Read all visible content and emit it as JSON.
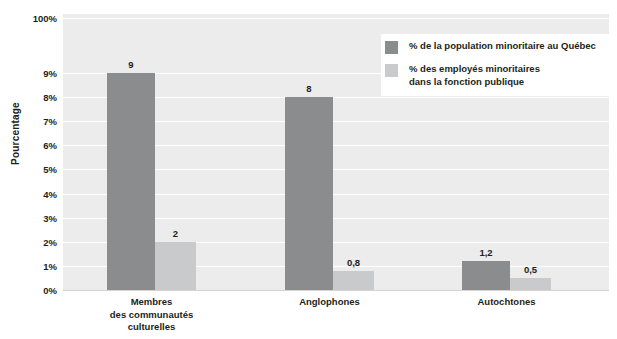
{
  "chart_data": {
    "type": "bar",
    "title": "",
    "subtitle": "",
    "xlabel": "",
    "ylabel": "Pourcentage",
    "categories": [
      "Membres\ndes communautés\nculturelles",
      "Anglophones",
      "Autochtones"
    ],
    "series": [
      {
        "name": "% de la population minoritaire au Québec",
        "color": "#8b8c8e",
        "values": [
          9,
          8,
          1.2
        ],
        "labels": [
          "9",
          "8",
          "1,2"
        ]
      },
      {
        "name": "% des employés minoritaires\ndans la fonction publique",
        "color": "#c9cacb",
        "values": [
          2,
          0.8,
          0.5
        ],
        "labels": [
          "2",
          "0,8",
          "0,5"
        ]
      }
    ],
    "ytick_labels": [
      "100%",
      "9%",
      "8%",
      "7%",
      "6%",
      "5%",
      "4%",
      "3%",
      "2%",
      "1%",
      "0%"
    ],
    "ytick_values": [
      100,
      9,
      8,
      7,
      6,
      5,
      4,
      3,
      2,
      1,
      0
    ],
    "axis_break": true,
    "ylim": [
      0,
      10
    ],
    "grid": true,
    "grid_color": "#ffffff",
    "plot_background": "#ececed",
    "legend_position": "top-right",
    "legend_entries": [
      "% de la population minoritaire au Québec",
      "% des employés minoritaires\ndans la fonction publique"
    ]
  },
  "axis": {
    "y_title": "Pourcentage"
  }
}
